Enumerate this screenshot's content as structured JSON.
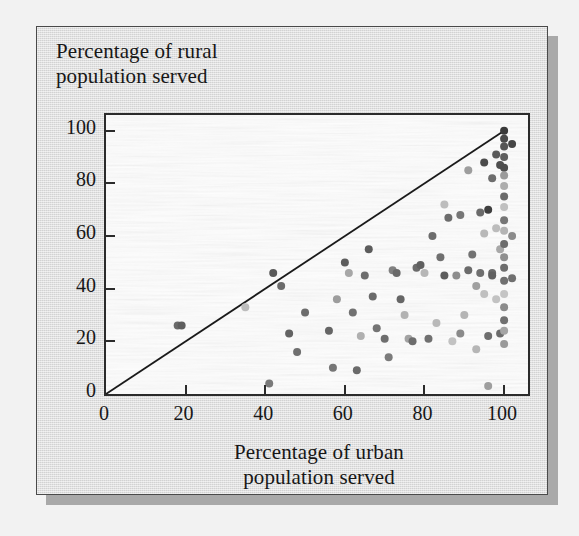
{
  "figure": {
    "background_color": "#dcdcdc",
    "plot_background_color": "#fdfdfd",
    "frame_color": "#2b2b2b",
    "shadow_color": "#a9a9a9"
  },
  "chart_data": {
    "type": "scatter",
    "title": "",
    "ylabel_line1": "Percentage of rural",
    "ylabel_line2": "population served",
    "xlabel_line1": "Percentage of urban",
    "xlabel_line2": "population served",
    "xlim": [
      0,
      106
    ],
    "ylim": [
      0,
      106
    ],
    "xticks": [
      0,
      20,
      40,
      60,
      80,
      100
    ],
    "yticks": [
      0,
      20,
      40,
      60,
      80,
      100
    ],
    "xtick_labels": [
      "0",
      "20",
      "40",
      "60",
      "80",
      "100"
    ],
    "ytick_labels": [
      "0",
      "20",
      "40",
      "60",
      "80",
      "100"
    ],
    "grid": false,
    "legend": false,
    "reference_line": {
      "label": "y = x equality line",
      "x": [
        0,
        100
      ],
      "y": [
        0,
        100
      ],
      "color": "#1a1a1a"
    },
    "marker": {
      "shape": "circle",
      "size_px": 8,
      "colors": [
        "#565656",
        "#6e6e6e",
        "#7f7f7f",
        "#9a9a9a",
        "#b4b4b4",
        "#c8c8c8",
        "#3f3f3f"
      ]
    },
    "points": [
      {
        "x": 18,
        "y": 26,
        "c": "#6a6a6a"
      },
      {
        "x": 19,
        "y": 26,
        "c": "#5e5e5e"
      },
      {
        "x": 35,
        "y": 33,
        "c": "#bcbcbc"
      },
      {
        "x": 41,
        "y": 4,
        "c": "#7a7a7a"
      },
      {
        "x": 42,
        "y": 46,
        "c": "#5a5a5a"
      },
      {
        "x": 44,
        "y": 41,
        "c": "#6b6b6b"
      },
      {
        "x": 46,
        "y": 23,
        "c": "#636363"
      },
      {
        "x": 48,
        "y": 16,
        "c": "#6f6f6f"
      },
      {
        "x": 50,
        "y": 31,
        "c": "#6c6c6c"
      },
      {
        "x": 56,
        "y": 24,
        "c": "#656565"
      },
      {
        "x": 57,
        "y": 10,
        "c": "#767676"
      },
      {
        "x": 58,
        "y": 36,
        "c": "#9d9d9d"
      },
      {
        "x": 60,
        "y": 50,
        "c": "#5d5d5d"
      },
      {
        "x": 61,
        "y": 46,
        "c": "#a7a7a7"
      },
      {
        "x": 62,
        "y": 31,
        "c": "#717171"
      },
      {
        "x": 63,
        "y": 9,
        "c": "#6a6a6a"
      },
      {
        "x": 64,
        "y": 22,
        "c": "#b0b0b0"
      },
      {
        "x": 65,
        "y": 45,
        "c": "#6d6d6d"
      },
      {
        "x": 66,
        "y": 55,
        "c": "#5c5c5c"
      },
      {
        "x": 67,
        "y": 37,
        "c": "#6a6a6a"
      },
      {
        "x": 68,
        "y": 25,
        "c": "#747474"
      },
      {
        "x": 70,
        "y": 21,
        "c": "#6e6e6e"
      },
      {
        "x": 71,
        "y": 14,
        "c": "#7b7b7b"
      },
      {
        "x": 72,
        "y": 47,
        "c": "#808080"
      },
      {
        "x": 73,
        "y": 46,
        "c": "#6a6a6a"
      },
      {
        "x": 74,
        "y": 36,
        "c": "#666666"
      },
      {
        "x": 75,
        "y": 30,
        "c": "#b2b2b2"
      },
      {
        "x": 76,
        "y": 21,
        "c": "#a3a3a3"
      },
      {
        "x": 77,
        "y": 20,
        "c": "#6d6d6d"
      },
      {
        "x": 78,
        "y": 48,
        "c": "#6b6b6b"
      },
      {
        "x": 79,
        "y": 49,
        "c": "#5f5f5f"
      },
      {
        "x": 80,
        "y": 46,
        "c": "#b6b6b6"
      },
      {
        "x": 81,
        "y": 21,
        "c": "#707070"
      },
      {
        "x": 82,
        "y": 60,
        "c": "#6c6c6c"
      },
      {
        "x": 83,
        "y": 27,
        "c": "#b9b9b9"
      },
      {
        "x": 84,
        "y": 52,
        "c": "#707070"
      },
      {
        "x": 85,
        "y": 72,
        "c": "#bdbdbd"
      },
      {
        "x": 85,
        "y": 45,
        "c": "#5c5c5c"
      },
      {
        "x": 86,
        "y": 67,
        "c": "#6c6c6c"
      },
      {
        "x": 87,
        "y": 20,
        "c": "#c2c2c2"
      },
      {
        "x": 88,
        "y": 45,
        "c": "#8d8d8d"
      },
      {
        "x": 89,
        "y": 68,
        "c": "#767676"
      },
      {
        "x": 89,
        "y": 23,
        "c": "#8a8a8a"
      },
      {
        "x": 90,
        "y": 30,
        "c": "#b5b5b5"
      },
      {
        "x": 91,
        "y": 85,
        "c": "#9d9d9d"
      },
      {
        "x": 91,
        "y": 47,
        "c": "#6b6b6b"
      },
      {
        "x": 92,
        "y": 53,
        "c": "#727272"
      },
      {
        "x": 93,
        "y": 41,
        "c": "#a0a0a0"
      },
      {
        "x": 93,
        "y": 17,
        "c": "#b6b6b6"
      },
      {
        "x": 94,
        "y": 69,
        "c": "#6a6a6a"
      },
      {
        "x": 94,
        "y": 46,
        "c": "#6f6f6f"
      },
      {
        "x": 95,
        "y": 88,
        "c": "#4c4c4c"
      },
      {
        "x": 95,
        "y": 61,
        "c": "#b8b8b8"
      },
      {
        "x": 95,
        "y": 38,
        "c": "#c0c0c0"
      },
      {
        "x": 96,
        "y": 70,
        "c": "#3e3e3e"
      },
      {
        "x": 96,
        "y": 22,
        "c": "#6e6e6e"
      },
      {
        "x": 96,
        "y": 3,
        "c": "#9e9e9e"
      },
      {
        "x": 97,
        "y": 82,
        "c": "#6d6d6d"
      },
      {
        "x": 97,
        "y": 46,
        "c": "#6a6a6a"
      },
      {
        "x": 97,
        "y": 45,
        "c": "#5f5f5f"
      },
      {
        "x": 98,
        "y": 91,
        "c": "#5a5a5a"
      },
      {
        "x": 98,
        "y": 63,
        "c": "#bcbcbc"
      },
      {
        "x": 98,
        "y": 36,
        "c": "#c2c2c2"
      },
      {
        "x": 99,
        "y": 87,
        "c": "#4f4f4f"
      },
      {
        "x": 99,
        "y": 55,
        "c": "#a8a8a8"
      },
      {
        "x": 99,
        "y": 23,
        "c": "#6b6b6b"
      },
      {
        "x": 100,
        "y": 100,
        "c": "#3a3a3a"
      },
      {
        "x": 100,
        "y": 97,
        "c": "#4a4a4a"
      },
      {
        "x": 100,
        "y": 94,
        "c": "#555555"
      },
      {
        "x": 100,
        "y": 90,
        "c": "#5f5f5f"
      },
      {
        "x": 100,
        "y": 86,
        "c": "#4d4d4d"
      },
      {
        "x": 100,
        "y": 83,
        "c": "#9b9b9b"
      },
      {
        "x": 100,
        "y": 79,
        "c": "#adadad"
      },
      {
        "x": 100,
        "y": 75,
        "c": "#6a6a6a"
      },
      {
        "x": 100,
        "y": 71,
        "c": "#c0c0c0"
      },
      {
        "x": 100,
        "y": 66,
        "c": "#767676"
      },
      {
        "x": 100,
        "y": 62,
        "c": "#b4b4b4"
      },
      {
        "x": 100,
        "y": 57,
        "c": "#6c6c6c"
      },
      {
        "x": 100,
        "y": 52,
        "c": "#8f8f8f"
      },
      {
        "x": 100,
        "y": 48,
        "c": "#6e6e6e"
      },
      {
        "x": 100,
        "y": 43,
        "c": "#707070"
      },
      {
        "x": 100,
        "y": 38,
        "c": "#c4c4c4"
      },
      {
        "x": 100,
        "y": 33,
        "c": "#8c8c8c"
      },
      {
        "x": 100,
        "y": 28,
        "c": "#707070"
      },
      {
        "x": 100,
        "y": 24,
        "c": "#a5a5a5"
      },
      {
        "x": 100,
        "y": 19,
        "c": "#9a9a9a"
      },
      {
        "x": 102,
        "y": 95,
        "c": "#454545"
      },
      {
        "x": 102,
        "y": 60,
        "c": "#8b8b8b"
      },
      {
        "x": 102,
        "y": 44,
        "c": "#6f6f6f"
      }
    ]
  }
}
